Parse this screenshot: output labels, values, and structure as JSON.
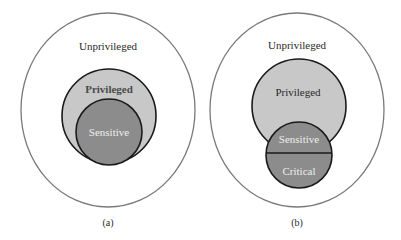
{
  "diagrams": [
    {
      "caption": "(a)",
      "outer_label": "Unprivileged",
      "middle_label": "Privileged",
      "inner_label": "Sensitive"
    },
    {
      "caption": "(b)",
      "outer_label": "Unprivileged",
      "middle_label": "Privileged",
      "inner_top_label": "Sensitive",
      "inner_bottom_label": "Critical"
    }
  ],
  "colors": {
    "outer_fill": "#ffffff",
    "privileged_fill": "#c8c8c8",
    "sensitive_fill": "#8c8c8c",
    "stroke": "#1a1a1a",
    "outer_stroke": "#7a7a7a",
    "dark_text": "#2a2a2a",
    "light_text": "#eeeeee"
  }
}
